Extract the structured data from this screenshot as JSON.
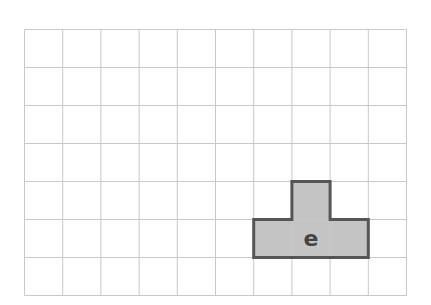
{
  "grid": {
    "columns": 10,
    "rows": 7,
    "cell_width": 38.2,
    "cell_height": 38,
    "line_color": "#c8c8c8",
    "background": "#ffffff"
  },
  "shape": {
    "label": "e",
    "fill": "#c4c4c4",
    "stroke": "#555555",
    "cells": [
      {
        "col": 7,
        "row": 4
      },
      {
        "col": 6,
        "row": 5
      },
      {
        "col": 7,
        "row": 5
      },
      {
        "col": 8,
        "row": 5
      }
    ],
    "label_cell": {
      "col": 7,
      "row": 5
    }
  }
}
